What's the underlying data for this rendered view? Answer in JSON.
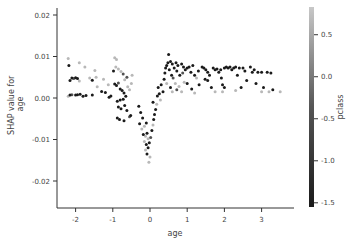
{
  "chart_data": {
    "type": "scatter",
    "title": "",
    "xlabel": "age",
    "ylabel": "SHAP value for\nage",
    "ylabel_lines": [
      "SHAP value for",
      "age"
    ],
    "xlim": [
      -2.45,
      3.85
    ],
    "ylim": [
      -0.0265,
      0.0225
    ],
    "xticks": [
      -2,
      -1,
      0,
      1,
      2,
      3
    ],
    "xtick_labels": [
      "-2",
      "-1",
      "0",
      "1",
      "2",
      "3"
    ],
    "yticks": [
      0.02,
      0.01,
      0.0,
      -0.01,
      -0.02
    ],
    "ytick_labels": [
      "0.02",
      "0.01",
      "0.00",
      "-0.01",
      "-0.02"
    ],
    "grid": false,
    "colorbar": {
      "label": "pclass",
      "range": [
        -1.55,
        0.83
      ],
      "ticks": [
        0.5,
        0.0,
        -0.5,
        -1.0,
        -1.5
      ],
      "tick_labels": [
        "0.5",
        "0.0",
        "-0.5",
        "-1.0",
        "-1.5"
      ],
      "color_low": "#1a1a1a",
      "color_high": "#c8c8c8"
    },
    "colors": {
      "axis": "#333333",
      "text": "#444444",
      "point_low": "#1a1a1a",
      "point_mid": "#555555",
      "point_high": "#b0b0b0"
    },
    "points": [
      {
        "x": -2.2,
        "y": 0.0095,
        "c": 0.83
      },
      {
        "x": -2.18,
        "y": 0.0078,
        "c": -1.55
      },
      {
        "x": -2.15,
        "y": 0.0042,
        "c": -1.55
      },
      {
        "x": -2.1,
        "y": 0.0048,
        "c": -1.55
      },
      {
        "x": -2.05,
        "y": 0.0047,
        "c": -0.4
      },
      {
        "x": -2.0,
        "y": 0.0049,
        "c": -1.55
      },
      {
        "x": -1.95,
        "y": 0.0047,
        "c": -1.55
      },
      {
        "x": -1.9,
        "y": 0.0041,
        "c": 0.83
      },
      {
        "x": -2.2,
        "y": 0.0004,
        "c": 0.83
      },
      {
        "x": -2.15,
        "y": 0.0007,
        "c": -1.55
      },
      {
        "x": -2.1,
        "y": 0.0008,
        "c": -0.4
      },
      {
        "x": -2.0,
        "y": 0.0007,
        "c": -1.55
      },
      {
        "x": -1.95,
        "y": 0.0008,
        "c": -1.55
      },
      {
        "x": -1.88,
        "y": 0.0009,
        "c": -1.55
      },
      {
        "x": -1.8,
        "y": 0.0004,
        "c": -1.55
      },
      {
        "x": -1.72,
        "y": 0.0006,
        "c": -1.55
      },
      {
        "x": -1.55,
        "y": 0.0007,
        "c": -1.55
      },
      {
        "x": -1.9,
        "y": 0.0085,
        "c": 0.83
      },
      {
        "x": -1.75,
        "y": 0.0075,
        "c": 0.83
      },
      {
        "x": -1.62,
        "y": 0.0048,
        "c": 0.83
      },
      {
        "x": -1.55,
        "y": 0.0043,
        "c": -1.55
      },
      {
        "x": -1.48,
        "y": 0.0066,
        "c": 0.83
      },
      {
        "x": -1.45,
        "y": 0.005,
        "c": 0.83
      },
      {
        "x": -1.42,
        "y": 0.0027,
        "c": 0.83
      },
      {
        "x": -1.3,
        "y": 0.0016,
        "c": -1.55
      },
      {
        "x": -1.2,
        "y": 0.0013,
        "c": -1.55
      },
      {
        "x": -1.1,
        "y": 0.0002,
        "c": -1.55
      },
      {
        "x": -1.05,
        "y": 0.0005,
        "c": -1.55
      },
      {
        "x": -1.25,
        "y": 0.0045,
        "c": 0.83
      },
      {
        "x": -1.12,
        "y": 0.0032,
        "c": 0.83
      },
      {
        "x": -0.95,
        "y": 0.0097,
        "c": 0.83
      },
      {
        "x": -0.9,
        "y": 0.0093,
        "c": 0.83
      },
      {
        "x": -0.98,
        "y": 0.0065,
        "c": -1.55
      },
      {
        "x": -0.92,
        "y": 0.0075,
        "c": 0.83
      },
      {
        "x": -0.85,
        "y": 0.007,
        "c": 0.83
      },
      {
        "x": -0.78,
        "y": 0.0064,
        "c": 0.83
      },
      {
        "x": -0.72,
        "y": 0.0058,
        "c": -0.4
      },
      {
        "x": -0.95,
        "y": 0.0034,
        "c": -1.55
      },
      {
        "x": -0.9,
        "y": 0.003,
        "c": -1.55
      },
      {
        "x": -0.85,
        "y": 0.0036,
        "c": -0.4
      },
      {
        "x": -0.8,
        "y": 0.0022,
        "c": -1.55
      },
      {
        "x": -0.75,
        "y": 0.0018,
        "c": -1.55
      },
      {
        "x": -0.7,
        "y": 0.0012,
        "c": -1.55
      },
      {
        "x": -0.88,
        "y": -0.0008,
        "c": -1.55
      },
      {
        "x": -0.8,
        "y": -0.0005,
        "c": -1.55
      },
      {
        "x": -0.72,
        "y": -0.0003,
        "c": -1.55
      },
      {
        "x": -0.65,
        "y": 0.0004,
        "c": -1.55
      },
      {
        "x": -0.6,
        "y": 0.0027,
        "c": 0.83
      },
      {
        "x": -0.55,
        "y": 0.002,
        "c": 0.83
      },
      {
        "x": -0.85,
        "y": -0.0022,
        "c": -1.55
      },
      {
        "x": -0.78,
        "y": -0.0026,
        "c": -1.55
      },
      {
        "x": -0.68,
        "y": -0.0018,
        "c": -1.55
      },
      {
        "x": -0.62,
        "y": -0.003,
        "c": -1.55
      },
      {
        "x": -0.52,
        "y": -0.0042,
        "c": -1.55
      },
      {
        "x": -0.88,
        "y": -0.0048,
        "c": -1.55
      },
      {
        "x": -0.82,
        "y": -0.0052,
        "c": -1.55
      },
      {
        "x": -0.7,
        "y": -0.0055,
        "c": -1.55
      },
      {
        "x": -0.55,
        "y": -0.0045,
        "c": -0.4
      },
      {
        "x": -0.62,
        "y": 0.005,
        "c": -0.4
      },
      {
        "x": -0.68,
        "y": 0.0044,
        "c": 0.83
      },
      {
        "x": -0.5,
        "y": 0.0035,
        "c": 0.83
      },
      {
        "x": -0.48,
        "y": 0.0055,
        "c": 0.83
      },
      {
        "x": -0.3,
        "y": -0.002,
        "c": -1.55
      },
      {
        "x": -0.25,
        "y": -0.0035,
        "c": -1.55
      },
      {
        "x": -0.2,
        "y": -0.0048,
        "c": -1.55
      },
      {
        "x": -0.28,
        "y": -0.0062,
        "c": -1.55
      },
      {
        "x": -0.22,
        "y": -0.0075,
        "c": 0.83
      },
      {
        "x": -0.15,
        "y": -0.0068,
        "c": 0.83
      },
      {
        "x": -0.1,
        "y": -0.006,
        "c": -1.55
      },
      {
        "x": -0.18,
        "y": -0.0088,
        "c": -1.55
      },
      {
        "x": -0.12,
        "y": -0.0092,
        "c": 0.83
      },
      {
        "x": -0.08,
        "y": -0.0085,
        "c": -1.55
      },
      {
        "x": -0.15,
        "y": -0.0105,
        "c": 0.83
      },
      {
        "x": -0.1,
        "y": -0.0112,
        "c": -1.55
      },
      {
        "x": -0.05,
        "y": -0.0098,
        "c": 0.83
      },
      {
        "x": -0.12,
        "y": -0.0125,
        "c": 0.83
      },
      {
        "x": -0.08,
        "y": -0.0135,
        "c": -1.55
      },
      {
        "x": -0.05,
        "y": -0.012,
        "c": -1.55
      },
      {
        "x": -0.02,
        "y": -0.0108,
        "c": -1.55
      },
      {
        "x": 0.02,
        "y": -0.0095,
        "c": -0.4
      },
      {
        "x": 0.0,
        "y": -0.0142,
        "c": 0.83
      },
      {
        "x": -0.03,
        "y": -0.0155,
        "c": 0.83
      },
      {
        "x": 0.05,
        "y": -0.0078,
        "c": -1.55
      },
      {
        "x": 0.08,
        "y": -0.0065,
        "c": 0.83
      },
      {
        "x": 0.1,
        "y": -0.0052,
        "c": -1.55
      },
      {
        "x": 0.12,
        "y": -0.004,
        "c": -1.55
      },
      {
        "x": 0.15,
        "y": -0.0028,
        "c": -1.55
      },
      {
        "x": 0.08,
        "y": -0.001,
        "c": -1.55
      },
      {
        "x": 0.18,
        "y": -0.0015,
        "c": 0.83
      },
      {
        "x": 0.2,
        "y": 0.0005,
        "c": -1.55
      },
      {
        "x": 0.25,
        "y": 0.001,
        "c": -1.55
      },
      {
        "x": 0.22,
        "y": 0.0025,
        "c": -1.55
      },
      {
        "x": 0.3,
        "y": 0.0032,
        "c": -1.55
      },
      {
        "x": 0.28,
        "y": -0.0005,
        "c": 0.83
      },
      {
        "x": 0.35,
        "y": 0.0015,
        "c": -1.55
      },
      {
        "x": 0.38,
        "y": 0.0045,
        "c": -1.55
      },
      {
        "x": 0.4,
        "y": 0.006,
        "c": -1.55
      },
      {
        "x": 0.42,
        "y": 0.0072,
        "c": -1.55
      },
      {
        "x": 0.45,
        "y": 0.0078,
        "c": -1.55
      },
      {
        "x": 0.5,
        "y": 0.0105,
        "c": -1.55
      },
      {
        "x": 0.48,
        "y": 0.0085,
        "c": -1.55
      },
      {
        "x": 0.55,
        "y": 0.0088,
        "c": -1.55
      },
      {
        "x": 0.6,
        "y": 0.0082,
        "c": -1.55
      },
      {
        "x": 0.52,
        "y": 0.0068,
        "c": -1.55
      },
      {
        "x": 0.58,
        "y": 0.0055,
        "c": -1.55
      },
      {
        "x": 0.62,
        "y": 0.0048,
        "c": -0.4
      },
      {
        "x": 0.45,
        "y": 0.0035,
        "c": 0.83
      },
      {
        "x": 0.55,
        "y": 0.0025,
        "c": -1.55
      },
      {
        "x": 0.65,
        "y": 0.0072,
        "c": -1.55
      },
      {
        "x": 0.7,
        "y": 0.0085,
        "c": -1.55
      },
      {
        "x": 0.72,
        "y": 0.0065,
        "c": -1.55
      },
      {
        "x": 0.75,
        "y": 0.0078,
        "c": -1.55
      },
      {
        "x": 0.8,
        "y": 0.0055,
        "c": -1.55
      },
      {
        "x": 0.68,
        "y": 0.0035,
        "c": 0.83
      },
      {
        "x": 0.78,
        "y": 0.0028,
        "c": 0.83
      },
      {
        "x": 0.6,
        "y": 0.0015,
        "c": 0.83
      },
      {
        "x": 0.72,
        "y": 0.002,
        "c": -0.4
      },
      {
        "x": 0.85,
        "y": 0.0082,
        "c": -1.55
      },
      {
        "x": 0.9,
        "y": 0.0075,
        "c": -1.55
      },
      {
        "x": 0.95,
        "y": 0.0068,
        "c": -1.55
      },
      {
        "x": 0.88,
        "y": 0.006,
        "c": -0.4
      },
      {
        "x": 1.0,
        "y": 0.0072,
        "c": -1.55
      },
      {
        "x": 1.05,
        "y": 0.0075,
        "c": -1.55
      },
      {
        "x": 0.92,
        "y": 0.0038,
        "c": 0.83
      },
      {
        "x": 1.0,
        "y": 0.0035,
        "c": -1.55
      },
      {
        "x": 0.85,
        "y": 0.0015,
        "c": 0.83
      },
      {
        "x": 1.1,
        "y": 0.0062,
        "c": -1.55
      },
      {
        "x": 1.15,
        "y": 0.0078,
        "c": -1.55
      },
      {
        "x": 1.2,
        "y": 0.0055,
        "c": -1.55
      },
      {
        "x": 1.25,
        "y": 0.0048,
        "c": 0.83
      },
      {
        "x": 1.3,
        "y": 0.0065,
        "c": -1.55
      },
      {
        "x": 1.32,
        "y": 0.0032,
        "c": -1.55
      },
      {
        "x": 1.12,
        "y": 0.0022,
        "c": -1.55
      },
      {
        "x": 1.2,
        "y": 0.0012,
        "c": 0.83
      },
      {
        "x": 1.4,
        "y": 0.0075,
        "c": -1.55
      },
      {
        "x": 1.45,
        "y": 0.0072,
        "c": -1.55
      },
      {
        "x": 1.5,
        "y": 0.0068,
        "c": -1.55
      },
      {
        "x": 1.55,
        "y": 0.0062,
        "c": -1.55
      },
      {
        "x": 1.48,
        "y": 0.0045,
        "c": -1.55
      },
      {
        "x": 1.55,
        "y": 0.0042,
        "c": -1.55
      },
      {
        "x": 1.6,
        "y": 0.0055,
        "c": -1.55
      },
      {
        "x": 1.7,
        "y": 0.0072,
        "c": -1.55
      },
      {
        "x": 1.75,
        "y": 0.0068,
        "c": -1.55
      },
      {
        "x": 1.8,
        "y": 0.007,
        "c": -1.55
      },
      {
        "x": 1.65,
        "y": 0.0025,
        "c": -1.55
      },
      {
        "x": 1.75,
        "y": 0.0015,
        "c": 0.83
      },
      {
        "x": 1.85,
        "y": 0.0062,
        "c": -1.55
      },
      {
        "x": 1.9,
        "y": 0.0068,
        "c": -1.55
      },
      {
        "x": 1.92,
        "y": 0.0048,
        "c": -1.55
      },
      {
        "x": 1.95,
        "y": 0.0032,
        "c": -1.55
      },
      {
        "x": 2.0,
        "y": 0.0072,
        "c": -1.55
      },
      {
        "x": 2.05,
        "y": 0.0075,
        "c": -1.55
      },
      {
        "x": 2.1,
        "y": 0.0072,
        "c": -1.55
      },
      {
        "x": 2.15,
        "y": 0.0075,
        "c": -1.55
      },
      {
        "x": 2.2,
        "y": 0.0068,
        "c": -1.55
      },
      {
        "x": 2.0,
        "y": 0.0025,
        "c": -1.55
      },
      {
        "x": 1.95,
        "y": 0.0015,
        "c": 0.83
      },
      {
        "x": 2.25,
        "y": 0.0072,
        "c": -1.55
      },
      {
        "x": 2.3,
        "y": 0.0075,
        "c": -1.55
      },
      {
        "x": 2.4,
        "y": 0.0072,
        "c": -1.55
      },
      {
        "x": 2.35,
        "y": 0.0055,
        "c": -1.55
      },
      {
        "x": 2.5,
        "y": 0.0072,
        "c": -1.55
      },
      {
        "x": 2.55,
        "y": 0.0065,
        "c": -1.55
      },
      {
        "x": 2.6,
        "y": 0.0042,
        "c": -1.55
      },
      {
        "x": 2.45,
        "y": 0.0025,
        "c": -1.55
      },
      {
        "x": 2.3,
        "y": 0.0018,
        "c": 0.83
      },
      {
        "x": 2.7,
        "y": 0.0075,
        "c": -1.55
      },
      {
        "x": 2.75,
        "y": 0.0062,
        "c": -1.55
      },
      {
        "x": 2.8,
        "y": 0.0068,
        "c": -1.55
      },
      {
        "x": 2.9,
        "y": 0.0062,
        "c": -1.55
      },
      {
        "x": 2.85,
        "y": 0.0035,
        "c": -1.55
      },
      {
        "x": 3.0,
        "y": 0.0062,
        "c": -1.55
      },
      {
        "x": 3.05,
        "y": 0.0025,
        "c": -1.55
      },
      {
        "x": 3.15,
        "y": 0.0062,
        "c": -1.55
      },
      {
        "x": 3.25,
        "y": 0.006,
        "c": -1.55
      },
      {
        "x": 3.2,
        "y": 0.0015,
        "c": 0.83
      },
      {
        "x": 3.0,
        "y": 0.0015,
        "c": 0.83
      },
      {
        "x": 3.5,
        "y": 0.0015,
        "c": 0.83
      },
      {
        "x": 3.3,
        "y": 0.002,
        "c": -1.55
      }
    ]
  }
}
